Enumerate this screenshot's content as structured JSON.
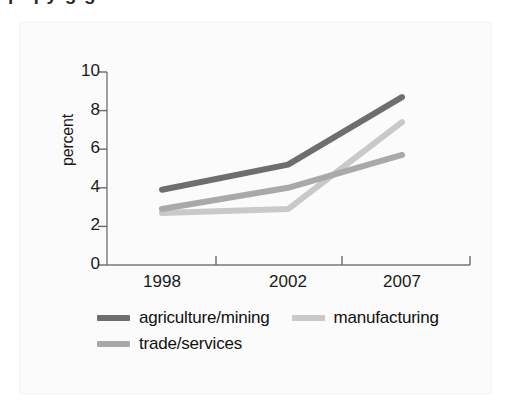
{
  "figure": {
    "background_color": "#fbfbfb",
    "clipped_caption_above": "p q y g g"
  },
  "chart_data": {
    "type": "line",
    "title": "",
    "subtitle": "",
    "xlabel": "",
    "ylabel": "percent",
    "x": [
      1998,
      2002,
      2007
    ],
    "categories": [
      "1998",
      "2002",
      "2007"
    ],
    "xtick_labels": [
      "1998",
      "2002",
      "2007"
    ],
    "ytick_labels": [
      "0",
      "2",
      "4",
      "6",
      "8",
      "10"
    ],
    "yticks": [
      0,
      2,
      4,
      6,
      8,
      10
    ],
    "ylim": [
      0,
      10
    ],
    "xlim": [
      1998,
      2007
    ],
    "grid": false,
    "legend_position": "below-axis",
    "series": [
      {
        "name": "agriculture/mining",
        "color": "#6e6e6e",
        "values": [
          3.9,
          5.2,
          8.7
        ]
      },
      {
        "name": "manufacturing",
        "color": "#c9c9c9",
        "values": [
          2.7,
          2.9,
          7.4
        ]
      },
      {
        "name": "trade/services",
        "color": "#a9a9a9",
        "values": [
          2.9,
          4.0,
          5.7
        ]
      }
    ]
  },
  "axis": {
    "y_label": "percent",
    "tick_color": "#6b6b6b",
    "line_color": "#777777"
  },
  "legend": {
    "rows": [
      [
        {
          "label": "agriculture/mining",
          "color": "#6e6e6e"
        },
        {
          "label": "manufacturing",
          "color": "#c9c9c9"
        }
      ],
      [
        {
          "label": "trade/services",
          "color": "#a9a9a9"
        }
      ]
    ]
  }
}
